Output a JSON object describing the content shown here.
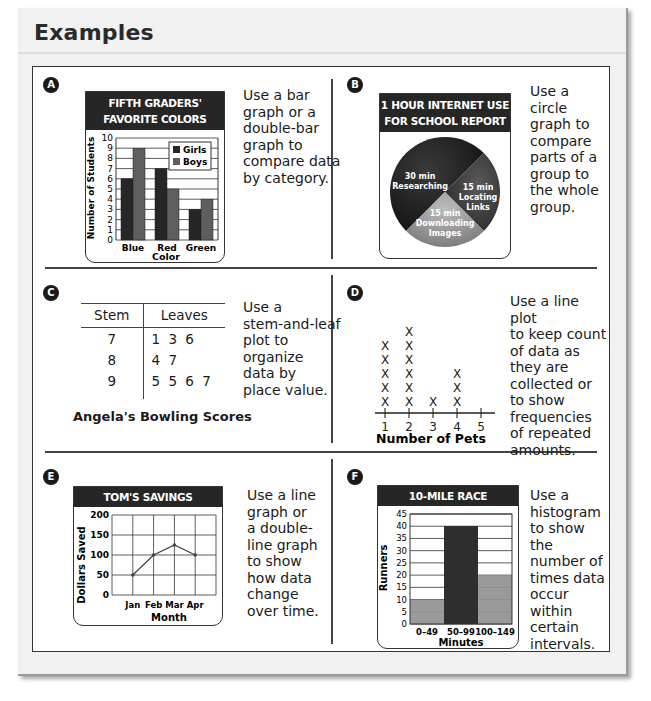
{
  "page": {
    "title": "Examples"
  },
  "sections": [
    {
      "badge": "A",
      "description": "Use a bar\ngraph or a\ndouble-bar\ngraph to\ncompare data\nby category."
    },
    {
      "badge": "B",
      "description": "Use a circle\ngraph to\ncompare\nparts of a\ngroup to\nthe whole\ngroup."
    },
    {
      "badge": "C",
      "description": "Use a\nstem-and-leaf\nplot to\norganize\ndata by\nplace value."
    },
    {
      "badge": "D",
      "description": "Use a line plot\nto keep count\nof data as\nthey are\ncollected or\nto show\nfrequencies\nof repeated\namounts."
    },
    {
      "badge": "E",
      "description": "Use a line\ngraph or\na double-\nline graph\nto show\nhow data\nchange\nover time."
    },
    {
      "badge": "F",
      "description": "Use a\nhistogram\nto show the\nnumber of\ntimes data\noccur within\ncertain\nintervals."
    }
  ],
  "colors": {
    "dark": "#262626",
    "medium": "#6e6e6e",
    "light": "#9c9c9c",
    "grid": "#333333"
  },
  "chart_data": [
    {
      "type": "bar",
      "title": "FIFTH GRADERS' FAVORITE COLORS",
      "title_line1": "FIFTH GRADERS'",
      "title_line2": "FAVORITE COLORS",
      "categories": [
        "Blue",
        "Red",
        "Green"
      ],
      "series": [
        {
          "name": "Girls",
          "values": [
            6,
            7,
            3
          ]
        },
        {
          "name": "Boys",
          "values": [
            9,
            5,
            4
          ]
        }
      ],
      "xlabel": "Color",
      "ylabel": "Number of Students",
      "ylim": [
        0,
        10
      ],
      "yticks": [
        0,
        1,
        2,
        3,
        4,
        5,
        6,
        7,
        8,
        9,
        10
      ],
      "grid": true,
      "legend_position": "upper right"
    },
    {
      "type": "pie",
      "title": "1 HOUR INTERNET USE FOR SCHOOL REPORT",
      "title_line1": "1 HOUR INTERNET USE",
      "title_line2": "FOR SCHOOL REPORT",
      "slices": [
        {
          "label": "30 min Researching",
          "line1": "30 min",
          "line2": "Researching",
          "value": 30
        },
        {
          "label": "15 min Locating Links",
          "line1": "15 min",
          "line2": "Locating",
          "line3": "Links",
          "value": 15
        },
        {
          "label": "15 min Downloading Images",
          "line1": "15 min",
          "line2": "Downloading",
          "line3": "Images",
          "value": 15
        }
      ]
    },
    {
      "type": "table",
      "title": "Angela's Bowling Scores",
      "columns": [
        "Stem",
        "Leaves"
      ],
      "rows": [
        {
          "stem": "7",
          "leaves": "1 3 6"
        },
        {
          "stem": "8",
          "leaves": "4 7"
        },
        {
          "stem": "9",
          "leaves": "5 5 6 7"
        }
      ]
    },
    {
      "type": "scatter",
      "subtype": "line plot",
      "xlabel": "Number of Pets",
      "x": [
        1,
        2,
        3,
        4,
        5
      ],
      "counts": [
        5,
        6,
        1,
        3,
        0
      ],
      "marker": "X"
    },
    {
      "type": "line",
      "title": "TOM'S SAVINGS",
      "categories": [
        "Jan",
        "Feb",
        "Mar",
        "Apr"
      ],
      "values": [
        50,
        100,
        125,
        100
      ],
      "xlabel": "Month",
      "ylabel": "Dollars Saved",
      "ylim": [
        0,
        200
      ],
      "yticks": [
        0,
        50,
        100,
        150,
        200
      ],
      "grid": true
    },
    {
      "type": "bar",
      "subtype": "histogram",
      "title": "10-MILE RACE",
      "categories": [
        "0–49",
        "50–99",
        "100–149"
      ],
      "values": [
        10,
        40,
        20
      ],
      "xlabel": "Minutes",
      "ylabel": "Runners",
      "ylim": [
        0,
        45
      ],
      "yticks": [
        0,
        5,
        10,
        15,
        20,
        25,
        30,
        35,
        40,
        45
      ],
      "grid": true
    }
  ]
}
